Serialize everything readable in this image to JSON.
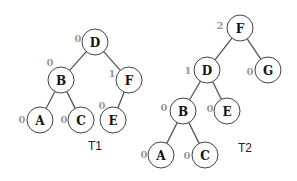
{
  "trees": [
    {
      "title": "T1",
      "title_pos": [
        95,
        146
      ],
      "nodes": [
        {
          "id": "D",
          "label": "D",
          "balance": "0",
          "x": 95,
          "y": 42,
          "bx": 78,
          "by": 38
        },
        {
          "id": "B",
          "label": "B",
          "balance": "0",
          "x": 61,
          "y": 80,
          "bx": 50,
          "by": 62
        },
        {
          "id": "F",
          "label": "F",
          "balance": "1",
          "x": 129,
          "y": 80,
          "bx": 112,
          "by": 73
        },
        {
          "id": "A",
          "label": "A",
          "balance": "0",
          "x": 40,
          "y": 120,
          "bx": 22,
          "by": 119
        },
        {
          "id": "C",
          "label": "C",
          "balance": "0",
          "x": 81,
          "y": 120,
          "bx": 64,
          "by": 119
        },
        {
          "id": "E",
          "label": "E",
          "balance": "0",
          "x": 113,
          "y": 120,
          "bx": 102,
          "by": 105
        }
      ],
      "edges": [
        [
          "D",
          "B"
        ],
        [
          "D",
          "F"
        ],
        [
          "B",
          "A"
        ],
        [
          "B",
          "C"
        ],
        [
          "F",
          "E"
        ]
      ]
    },
    {
      "title": "T2",
      "title_pos": [
        245,
        148
      ],
      "nodes": [
        {
          "id": "F",
          "label": "F",
          "balance": "2",
          "x": 240,
          "y": 28,
          "bx": 220,
          "by": 25
        },
        {
          "id": "D",
          "label": "D",
          "balance": "1",
          "x": 207,
          "y": 70,
          "bx": 188,
          "by": 70
        },
        {
          "id": "G",
          "label": "G",
          "balance": "0",
          "x": 268,
          "y": 70,
          "bx": 250,
          "by": 71
        },
        {
          "id": "B",
          "label": "B",
          "balance": "0",
          "x": 183,
          "y": 111,
          "bx": 164,
          "by": 107
        },
        {
          "id": "E",
          "label": "E",
          "balance": "0",
          "x": 227,
          "y": 111,
          "bx": 210,
          "by": 108
        },
        {
          "id": "A",
          "label": "A",
          "balance": "0",
          "x": 161,
          "y": 155,
          "bx": 144,
          "by": 154
        },
        {
          "id": "C",
          "label": "C",
          "balance": "0",
          "x": 205,
          "y": 155,
          "bx": 187,
          "by": 155
        }
      ],
      "edges": [
        [
          "F",
          "D"
        ],
        [
          "F",
          "G"
        ],
        [
          "D",
          "B"
        ],
        [
          "D",
          "E"
        ],
        [
          "B",
          "A"
        ],
        [
          "B",
          "C"
        ]
      ]
    }
  ],
  "node_radius": 13
}
